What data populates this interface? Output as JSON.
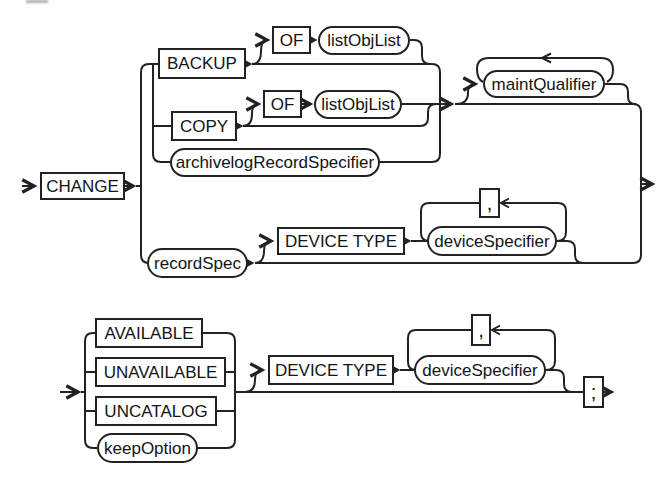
{
  "colors": {
    "line": "#222222",
    "text": "#141414",
    "background": "#ffffff"
  },
  "part1": {
    "change": "CHANGE",
    "backup": "BACKUP",
    "backup_of": "OF",
    "backup_list_obj_list": "listObjList",
    "copy": "COPY",
    "copy_of": "OF",
    "copy_list_obj_list": "listObjList",
    "archivelog_record_specifier": "archivelogRecordSpecifier",
    "maint_qualifier": "maintQualifier",
    "record_spec": "recordSpec",
    "device_type": "DEVICE TYPE",
    "comma": ",",
    "device_specifier": "deviceSpecifier"
  },
  "part2": {
    "available": "AVAILABLE",
    "unavailable": "UNAVAILABLE",
    "uncatalog": "UNCATALOG",
    "keep_option": "keepOption",
    "device_type": "DEVICE TYPE",
    "comma": ",",
    "device_specifier": "deviceSpecifier",
    "semicolon": ";"
  }
}
